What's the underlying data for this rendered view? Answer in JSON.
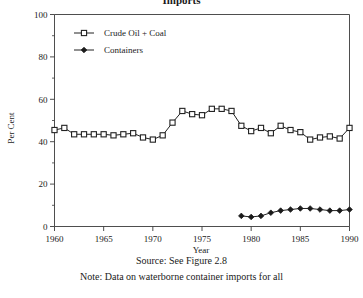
{
  "figure": {
    "title_fragment": "Imports",
    "source_text": "Source: See Figure 2.8",
    "note_text": "Note: Data on waterborne container imports for all"
  },
  "chart_data": {
    "type": "line",
    "title": "",
    "xlabel": "Year",
    "ylabel": "Per Cent",
    "xlim": [
      1960,
      1990
    ],
    "ylim": [
      0,
      100
    ],
    "xticks": [
      1960,
      1965,
      1970,
      1975,
      1980,
      1985,
      1990
    ],
    "yticks": [
      0,
      20,
      40,
      60,
      80,
      100
    ],
    "minor_yticks": [
      10,
      30,
      50,
      70,
      90
    ],
    "grid": false,
    "legend_position": "upper-left",
    "x": [
      1960,
      1961,
      1962,
      1963,
      1964,
      1965,
      1966,
      1967,
      1968,
      1969,
      1970,
      1971,
      1972,
      1973,
      1974,
      1975,
      1976,
      1977,
      1978,
      1979,
      1980,
      1981,
      1982,
      1983,
      1984,
      1985,
      1986,
      1987,
      1988,
      1989,
      1990
    ],
    "series": [
      {
        "name": "Crude Oil + Coal",
        "marker": "open-square",
        "values": [
          45.5,
          46.5,
          43.5,
          43.5,
          43.5,
          43.5,
          43.0,
          43.5,
          44.0,
          42.0,
          41.0,
          43.0,
          49.0,
          54.5,
          53.0,
          52.5,
          55.5,
          55.5,
          54.5,
          47.5,
          45.0,
          46.5,
          44.0,
          47.5,
          45.5,
          44.5,
          41.0,
          42.0,
          42.5,
          41.5,
          46.5
        ]
      },
      {
        "name": "Containers",
        "marker": "filled-diamond",
        "x": [
          1979,
          1980,
          1981,
          1982,
          1983,
          1984,
          1985,
          1986,
          1987,
          1988,
          1989,
          1990
        ],
        "values": [
          5.0,
          4.5,
          5.0,
          6.5,
          7.5,
          8.0,
          8.5,
          8.5,
          8.0,
          7.5,
          7.5,
          8.0
        ]
      }
    ]
  },
  "legend": {
    "items": [
      {
        "label": "Crude Oil + Coal"
      },
      {
        "label": "Containers"
      }
    ]
  },
  "colors": {
    "axis": "#3a3a3a",
    "series_line": "#222222",
    "marker_fill": "#ffffff",
    "marker_stroke": "#222222",
    "containers": "#1a1a1a"
  }
}
